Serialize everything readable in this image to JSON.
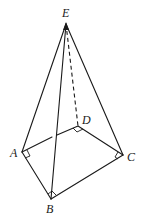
{
  "diagram": {
    "type": "pyramid",
    "labels": {
      "E": "E",
      "A": "A",
      "B": "B",
      "C": "C",
      "D": "D"
    },
    "vertices": {
      "E": [
        66,
        24
      ],
      "A": [
        22,
        152
      ],
      "B": [
        51,
        199
      ],
      "C": [
        123,
        155
      ],
      "D": [
        78,
        126
      ]
    },
    "visible_edges": [
      [
        "E",
        "A"
      ],
      [
        "E",
        "B"
      ],
      [
        "E",
        "C"
      ],
      [
        "A",
        "B"
      ],
      [
        "B",
        "C"
      ],
      [
        "C",
        "D"
      ],
      [
        "A",
        "D"
      ]
    ],
    "hidden_edges": [
      [
        "E",
        "D"
      ]
    ],
    "right_angles": [
      "A",
      "B",
      "C",
      "D"
    ],
    "stroke_color": "#1a1a1a"
  }
}
